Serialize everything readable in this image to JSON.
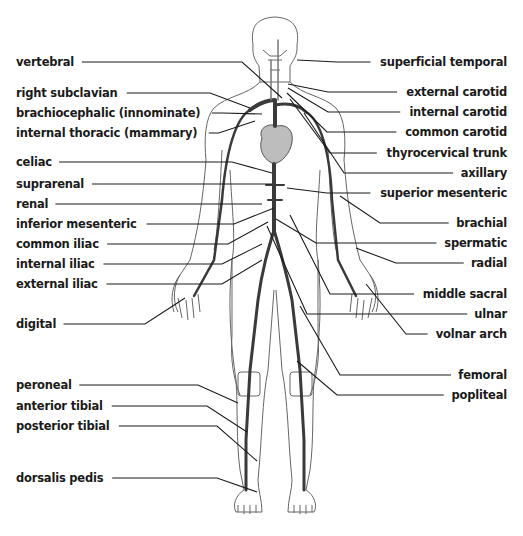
{
  "colors": {
    "outline": "#555555",
    "artery": "#3a3a3a",
    "heart": "#bdbdbd",
    "leader": "#1a1a1a",
    "text": "#1a1a1a"
  },
  "labels_left": [
    {
      "text": "vertebral",
      "y": 62,
      "to": [
        282,
        98
      ]
    },
    {
      "text": "right subclavian",
      "y": 93,
      "to": [
        250,
        108
      ]
    },
    {
      "text": "brachiocephalic (innominate)",
      "y": 113,
      "to": [
        262,
        114
      ]
    },
    {
      "text": "internal thoracic (mammary)",
      "y": 133,
      "to": [
        255,
        121
      ]
    },
    {
      "text": "celiac",
      "y": 162,
      "to": [
        272,
        173
      ]
    },
    {
      "text": "suprarenal",
      "y": 184,
      "to": [
        272,
        184
      ]
    },
    {
      "text": "renal",
      "y": 204,
      "to": [
        262,
        204
      ]
    },
    {
      "text": "inferior mesenteric",
      "y": 224,
      "to": [
        274,
        208
      ]
    },
    {
      "text": "common iliac",
      "y": 244,
      "to": [
        268,
        222
      ]
    },
    {
      "text": "internal iliac",
      "y": 264,
      "to": [
        262,
        244
      ]
    },
    {
      "text": "external iliac",
      "y": 284,
      "to": [
        262,
        260
      ]
    },
    {
      "text": "digital",
      "y": 324,
      "to": [
        185,
        298
      ]
    },
    {
      "text": "peroneal",
      "y": 385,
      "to": [
        238,
        403
      ]
    },
    {
      "text": "anterior tibial",
      "y": 406,
      "to": [
        247,
        432
      ]
    },
    {
      "text": "posterior tibial",
      "y": 426,
      "to": [
        257,
        461
      ]
    },
    {
      "text": "dorsalis pedis",
      "y": 478,
      "to": [
        257,
        492
      ]
    }
  ],
  "labels_right": [
    {
      "text": "superficial temporal",
      "y": 62,
      "to": [
        297,
        60
      ]
    },
    {
      "text": "external carotid",
      "y": 92,
      "to": [
        288,
        84
      ]
    },
    {
      "text": "internal carotid",
      "y": 112,
      "to": [
        288,
        88
      ]
    },
    {
      "text": "common carotid",
      "y": 132,
      "to": [
        287,
        93
      ]
    },
    {
      "text": "thyrocervical trunk",
      "y": 153,
      "to": [
        290,
        99
      ]
    },
    {
      "text": "axillary",
      "y": 173,
      "to": [
        304,
        113
      ]
    },
    {
      "text": "superior mesenteric",
      "y": 193,
      "to": [
        287,
        188
      ]
    },
    {
      "text": "brachial",
      "y": 223,
      "to": [
        340,
        196
      ]
    },
    {
      "text": "spermatic",
      "y": 243,
      "to": [
        276,
        219
      ]
    },
    {
      "text": "radial",
      "y": 263,
      "to": [
        356,
        248
      ]
    },
    {
      "text": "middle sacral",
      "y": 294,
      "to": [
        290,
        215
      ]
    },
    {
      "text": "ulnar",
      "y": 314,
      "to": [
        267,
        226
      ]
    },
    {
      "text": "volnar arch",
      "y": 334,
      "to": [
        366,
        284
      ]
    },
    {
      "text": "femoral",
      "y": 375,
      "to": [
        300,
        306
      ]
    },
    {
      "text": "popliteal",
      "y": 395,
      "to": [
        297,
        361
      ]
    }
  ]
}
